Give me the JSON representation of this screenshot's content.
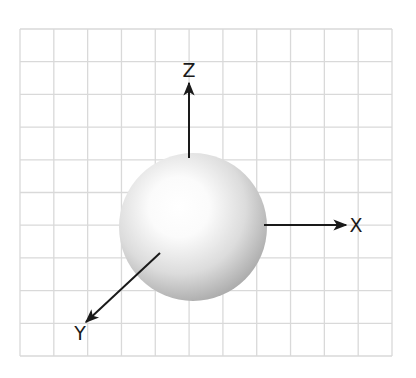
{
  "diagram": {
    "grid": {
      "left": 20,
      "top": 29,
      "right": 392,
      "bottom": 356,
      "columns": 11,
      "rows": 10,
      "line_color": "#d9d9d9"
    },
    "sphere": {
      "cx": 193,
      "cy": 227,
      "r": 74,
      "highlight_color": "#ffffff",
      "mid_color": "#e6e6e6",
      "shadow_color": "#9a9a9a"
    },
    "axes": [
      {
        "name": "z",
        "label": "Z",
        "x1": 189,
        "y1": 158,
        "x2": 189,
        "y2": 83,
        "label_x": 189,
        "label_y": 77
      },
      {
        "name": "x",
        "label": "X",
        "x1": 264,
        "y1": 225,
        "x2": 346,
        "y2": 225,
        "label_x": 356,
        "label_y": 232
      },
      {
        "name": "y",
        "label": "Y",
        "x1": 160,
        "y1": 253,
        "x2": 86,
        "y2": 322,
        "label_x": 80,
        "label_y": 340
      }
    ],
    "axis_color": "#1a1a1a"
  }
}
